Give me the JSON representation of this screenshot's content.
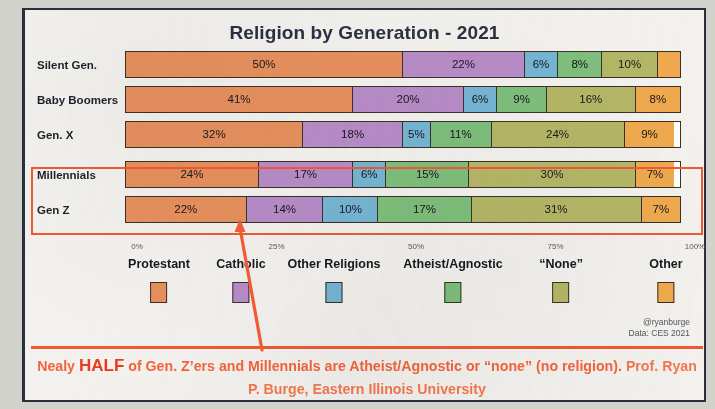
{
  "chart_data": {
    "type": "bar",
    "orientation": "horizontal",
    "stacked": true,
    "normalized_percent": true,
    "title": "Religion by Generation - 2021",
    "xlabel": "",
    "ylabel": "",
    "xlim": [
      0,
      100
    ],
    "grid": false,
    "legend_position": "bottom",
    "categories": [
      "Silent Gen.",
      "Baby Boomers",
      "Gen. X",
      "Millennials",
      "Gen Z"
    ],
    "tick_labels": [
      "0%",
      "25%",
      "50%",
      "75%",
      "100%"
    ],
    "tick_values": [
      0,
      25,
      50,
      75,
      100
    ],
    "series": [
      {
        "name": "Protestant",
        "color": "#e8905e",
        "values": [
          50,
          41,
          32,
          24,
          22
        ],
        "labels": [
          "50%",
          "41%",
          "32%",
          "24%",
          "22%"
        ]
      },
      {
        "name": "Catholic",
        "color": "#b88cc8",
        "values": [
          22,
          20,
          18,
          17,
          14
        ],
        "labels": [
          "22%",
          "20%",
          "18%",
          "17%",
          "14%"
        ]
      },
      {
        "name": "Other Religions",
        "color": "#76b6d4",
        "values": [
          6,
          6,
          5,
          6,
          10
        ],
        "labels": [
          "6%",
          "6%",
          "5%",
          "6%",
          "10%"
        ]
      },
      {
        "name": "Atheist/Agnostic",
        "color": "#7fbf7c",
        "values": [
          8,
          9,
          11,
          15,
          17
        ],
        "labels": [
          "8%",
          "9%",
          "11%",
          "15%",
          "17%"
        ]
      },
      {
        "name": "“None”",
        "color": "#b5b767",
        "values": [
          10,
          16,
          24,
          30,
          31
        ],
        "labels": [
          "10%",
          "16%",
          "24%",
          "30%",
          "31%"
        ]
      },
      {
        "name": "Other",
        "color": "#f0a94e",
        "values": [
          4,
          8,
          9,
          7,
          7
        ],
        "labels": [
          "",
          "8%",
          "9%",
          "7%",
          "7%"
        ]
      }
    ],
    "annotations": [
      "Highlight box around Millennials and Gen Z rows",
      "Arrow pointing from caption up to Gen Z bar"
    ]
  },
  "credits": {
    "handle": "@ryanburge",
    "source": "Data: CES 2021"
  },
  "caption": {
    "lead": "Nealy ",
    "emphasis": "HALF",
    "middle": " of Gen. Z’ers and Millennials are Atheist/Agnostic or “none” (no religion). ",
    "attribution": "Prof. Ryan P. Burge, Eastern Illinois University"
  },
  "colors": {
    "accent": "#f05a34",
    "title": "#2b3142",
    "caption": "#f4643c",
    "emphasis": "#ea3a1e"
  }
}
